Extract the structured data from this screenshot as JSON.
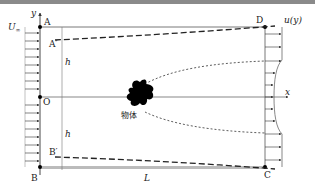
{
  "diagram": {
    "title": "",
    "points": {
      "A": "A",
      "A_prime": "A′",
      "B": "B",
      "B_prime": "B′",
      "C": "C",
      "D": "D",
      "O": "O"
    },
    "axes": {
      "x": "x",
      "y": "y"
    },
    "labels": {
      "freestream": "U∞",
      "freestream_base": "U",
      "freestream_sub": "∞",
      "outlet_profile": "u(y)",
      "height_top": "h",
      "height_bottom": "h",
      "length": "L",
      "body": "物体"
    },
    "colors": {
      "lines": "#333333",
      "border": "#8a8a8a",
      "body": "#000000"
    }
  }
}
